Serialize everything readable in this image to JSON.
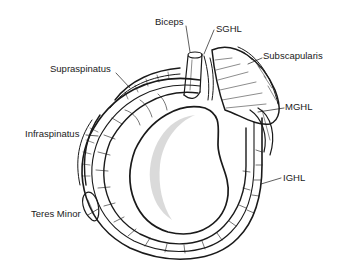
{
  "diagram": {
    "labels": {
      "biceps": "Biceps",
      "sghl": "SGHL",
      "subscapularis": "Subscapularis",
      "supraspinatus": "Supraspinatus",
      "mghl": "MGHL",
      "infraspinatus": "Infraspinatus",
      "teres_minor": "Teres Minor",
      "ighl": "IGHL"
    },
    "colors": {
      "ink": "#1a1a1a",
      "cartilage_shade": "#d4d4d4",
      "background": "#ffffff"
    }
  }
}
